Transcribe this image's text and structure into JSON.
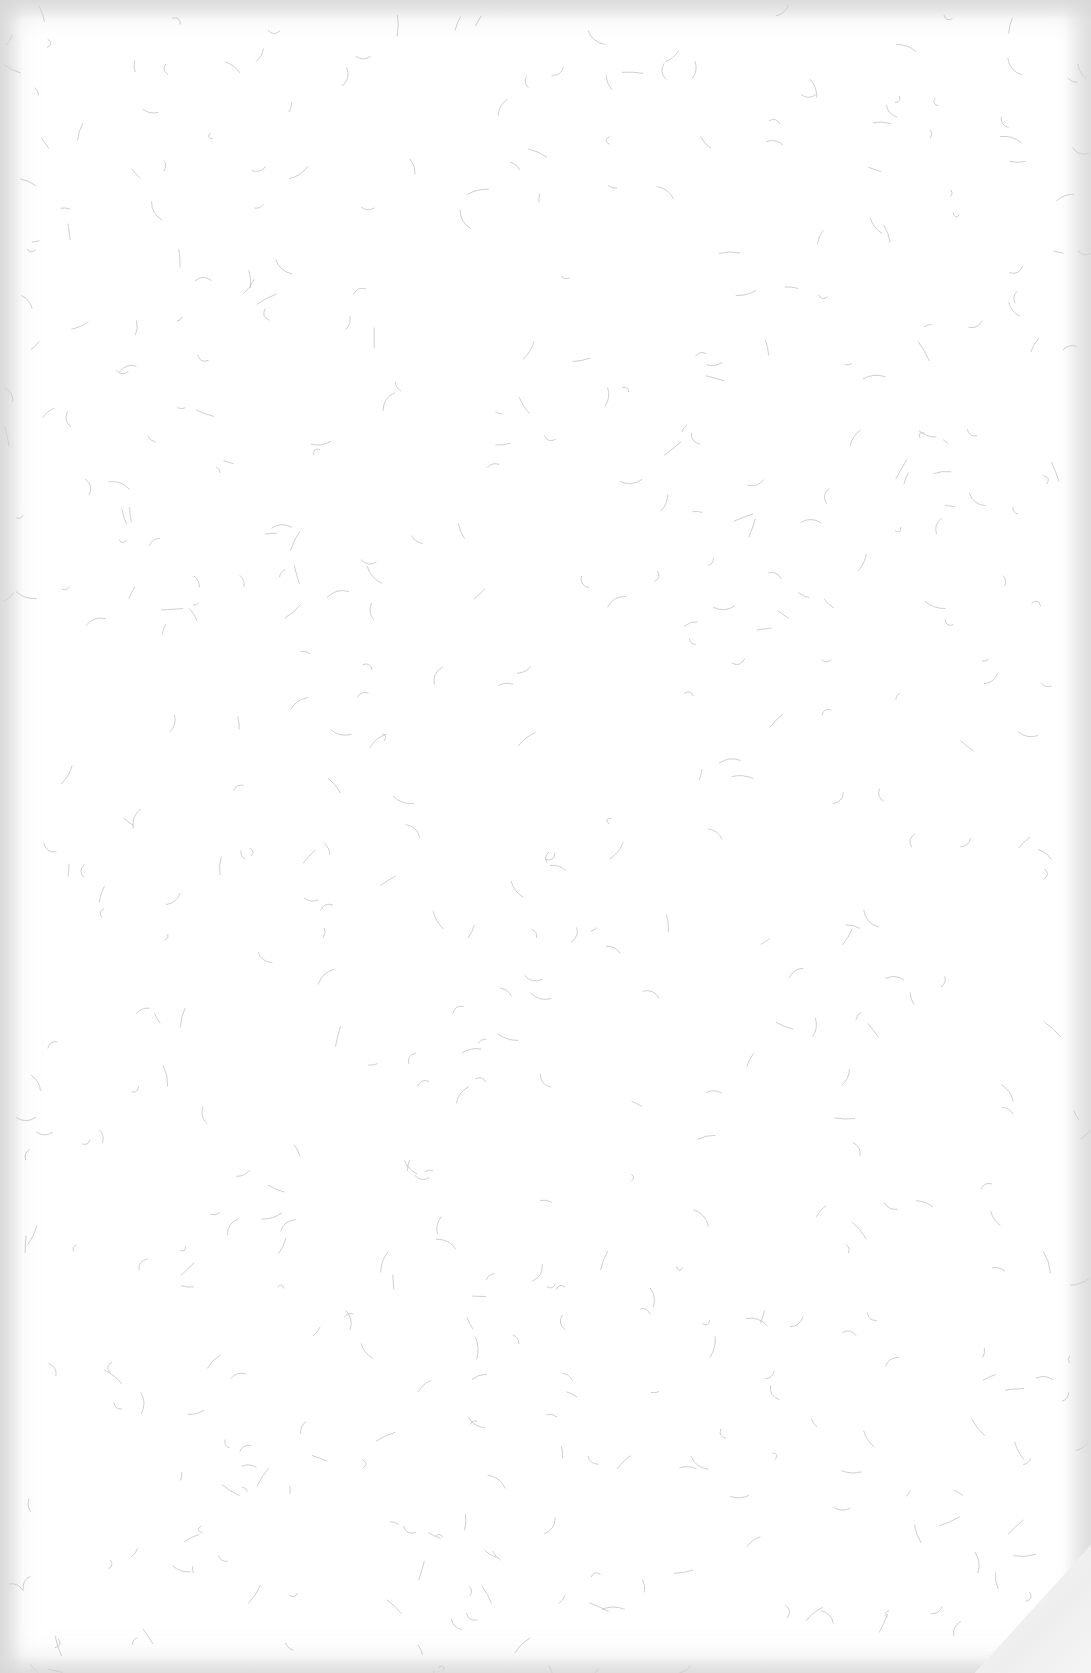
{
  "page": {
    "background_color": "#ffffff",
    "fiber_color": "#b8b8b8",
    "edge_shadow_color": "#d7d7d7",
    "corner_fold": "bottom-right",
    "fiber_count": 520
  }
}
